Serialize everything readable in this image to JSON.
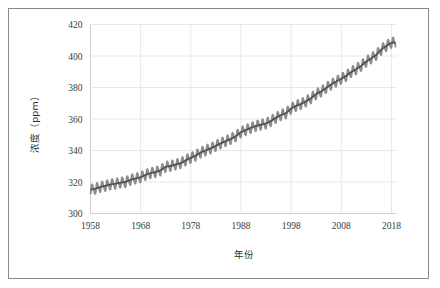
{
  "chart_data": {
    "type": "line",
    "title": "",
    "xlabel": "年份",
    "ylabel": "浓度（ppm）",
    "xlim": [
      1958,
      2019
    ],
    "ylim": [
      300,
      420
    ],
    "xticks": [
      1958,
      1968,
      1978,
      1988,
      1998,
      2008,
      2018
    ],
    "yticks": [
      300,
      320,
      340,
      360,
      380,
      400,
      420
    ],
    "xtick_labels": [
      "1958",
      "1968",
      "1978",
      "1988",
      "1998",
      "2008",
      "2018"
    ],
    "ytick_labels": [
      "300",
      "320",
      "340",
      "360",
      "380",
      "400",
      "420"
    ],
    "grid": true,
    "legend": "none",
    "series": [
      {
        "name": "月均值（含季节波动）",
        "style": "sawtooth-oscillation",
        "color": "#8c8c8c",
        "seasonal_amplitude_ppm": 3.0,
        "x": [
          1958,
          1959,
          1960,
          1961,
          1962,
          1963,
          1964,
          1965,
          1966,
          1967,
          1968,
          1969,
          1970,
          1971,
          1972,
          1973,
          1974,
          1975,
          1976,
          1977,
          1978,
          1979,
          1980,
          1981,
          1982,
          1983,
          1984,
          1985,
          1986,
          1987,
          1988,
          1989,
          1990,
          1991,
          1992,
          1993,
          1994,
          1995,
          1996,
          1997,
          1998,
          1999,
          2000,
          2001,
          2002,
          2003,
          2004,
          2005,
          2006,
          2007,
          2008,
          2009,
          2010,
          2011,
          2012,
          2013,
          2014,
          2015,
          2016,
          2017,
          2018
        ],
        "values": [
          315.0,
          315.8,
          316.9,
          317.6,
          318.5,
          318.9,
          319.6,
          320.0,
          321.4,
          322.2,
          323.0,
          324.6,
          325.7,
          326.3,
          327.5,
          329.7,
          330.2,
          331.1,
          332.0,
          333.8,
          335.4,
          336.8,
          338.8,
          340.1,
          341.4,
          343.0,
          344.6,
          346.0,
          347.4,
          349.2,
          351.6,
          353.1,
          354.4,
          355.6,
          356.4,
          357.1,
          358.8,
          360.8,
          362.6,
          363.7,
          366.7,
          368.4,
          369.6,
          371.2,
          373.3,
          375.8,
          377.5,
          379.8,
          381.9,
          383.8,
          385.6,
          387.4,
          389.9,
          391.7,
          393.9,
          396.5,
          398.6,
          400.8,
          404.2,
          406.5,
          408.5
        ]
      },
      {
        "name": "趋势线（平滑）",
        "style": "smooth-trend",
        "color": "#4d4d4d",
        "x": [
          1958,
          1959,
          1960,
          1961,
          1962,
          1963,
          1964,
          1965,
          1966,
          1967,
          1968,
          1969,
          1970,
          1971,
          1972,
          1973,
          1974,
          1975,
          1976,
          1977,
          1978,
          1979,
          1980,
          1981,
          1982,
          1983,
          1984,
          1985,
          1986,
          1987,
          1988,
          1989,
          1990,
          1991,
          1992,
          1993,
          1994,
          1995,
          1996,
          1997,
          1998,
          1999,
          2000,
          2001,
          2002,
          2003,
          2004,
          2005,
          2006,
          2007,
          2008,
          2009,
          2010,
          2011,
          2012,
          2013,
          2014,
          2015,
          2016,
          2017,
          2018
        ],
        "values": [
          315.0,
          315.8,
          316.9,
          317.6,
          318.5,
          318.9,
          319.6,
          320.0,
          321.4,
          322.2,
          323.0,
          324.6,
          325.7,
          326.3,
          327.5,
          329.7,
          330.2,
          331.1,
          332.0,
          333.8,
          335.4,
          336.8,
          338.8,
          340.1,
          341.4,
          343.0,
          344.6,
          346.0,
          347.4,
          349.2,
          351.6,
          353.1,
          354.4,
          355.6,
          356.4,
          357.1,
          358.8,
          360.8,
          362.6,
          363.7,
          366.7,
          368.4,
          369.6,
          371.2,
          373.3,
          375.8,
          377.5,
          379.8,
          381.9,
          383.8,
          385.6,
          387.4,
          389.9,
          391.7,
          393.9,
          396.5,
          398.6,
          400.8,
          404.2,
          406.5,
          408.5
        ]
      }
    ],
    "colors": {
      "oscillation": "#8c8c8c",
      "trend": "#4d4d4d",
      "grid": "#e8e8e8",
      "axis": "#d0d0d0",
      "frame": "#8a8a8a",
      "text": "#3a3a3a",
      "background": "#ffffff"
    }
  }
}
